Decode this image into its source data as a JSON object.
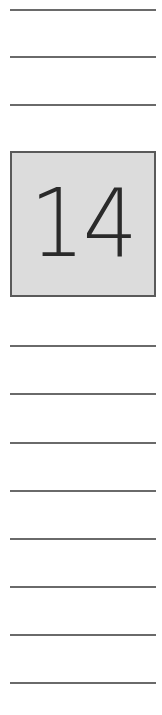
{
  "page": {
    "number_label": "14",
    "colors": {
      "rule": "#6a6a6a",
      "box_background": "#dcdcdc",
      "box_border": "#5a5a5a",
      "number_text": "#2a2a2a"
    }
  },
  "rules_above": [
    {
      "top": 10
    },
    {
      "top": 57
    },
    {
      "top": 105
    }
  ],
  "rules_below": [
    {
      "top": 346
    },
    {
      "top": 394
    },
    {
      "top": 443
    },
    {
      "top": 491
    },
    {
      "top": 539
    },
    {
      "top": 587
    },
    {
      "top": 635
    },
    {
      "top": 683
    }
  ]
}
